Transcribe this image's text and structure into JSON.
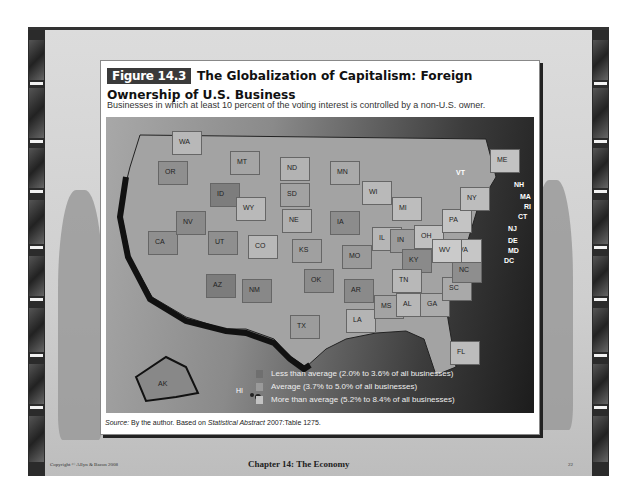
{
  "figure": {
    "badge": "Figure 14.3",
    "title": "The Globalization of Capitalism: Foreign Ownership of U.S. Business",
    "subtitle": "Businesses in which at least 10 percent of the voting interest is controlled by a non-U.S. owner."
  },
  "map": {
    "states": [
      {
        "code": "WA",
        "x": 42,
        "y": 12,
        "shade": "#b8b8b8"
      },
      {
        "code": "OR",
        "x": 28,
        "y": 42,
        "shade": "#8f8f8f"
      },
      {
        "code": "CA",
        "x": 18,
        "y": 112,
        "shade": "#8f8f8f"
      },
      {
        "code": "ID",
        "x": 80,
        "y": 64,
        "shade": "#7d7d7d"
      },
      {
        "code": "NV",
        "x": 46,
        "y": 92,
        "shade": "#8a8a8a"
      },
      {
        "code": "MT",
        "x": 100,
        "y": 32,
        "shade": "#a5a5a5"
      },
      {
        "code": "WY",
        "x": 106,
        "y": 78,
        "shade": "#b9b9b9"
      },
      {
        "code": "UT",
        "x": 78,
        "y": 112,
        "shade": "#8f8f8f"
      },
      {
        "code": "CO",
        "x": 118,
        "y": 116,
        "shade": "#b8b8b8"
      },
      {
        "code": "AZ",
        "x": 76,
        "y": 155,
        "shade": "#7c7c7c"
      },
      {
        "code": "NM",
        "x": 112,
        "y": 160,
        "shade": "#888888"
      },
      {
        "code": "ND",
        "x": 150,
        "y": 38,
        "shade": "#b3b3b3"
      },
      {
        "code": "SD",
        "x": 150,
        "y": 64,
        "shade": "#a2a2a2"
      },
      {
        "code": "NE",
        "x": 152,
        "y": 90,
        "shade": "#b0b0b0"
      },
      {
        "code": "KS",
        "x": 162,
        "y": 120,
        "shade": "#a0a0a0"
      },
      {
        "code": "OK",
        "x": 174,
        "y": 150,
        "shade": "#8c8c8c"
      },
      {
        "code": "TX",
        "x": 160,
        "y": 196,
        "shade": "#9c9c9c"
      },
      {
        "code": "MN",
        "x": 200,
        "y": 42,
        "shade": "#a9a9a9"
      },
      {
        "code": "IA",
        "x": 200,
        "y": 92,
        "shade": "#8c8c8c"
      },
      {
        "code": "MO",
        "x": 212,
        "y": 126,
        "shade": "#9a9a9a"
      },
      {
        "code": "AR",
        "x": 214,
        "y": 160,
        "shade": "#8a8a8a"
      },
      {
        "code": "LA",
        "x": 216,
        "y": 190,
        "shade": "#b4b4b4"
      },
      {
        "code": "WI",
        "x": 232,
        "y": 62,
        "shade": "#b9b9b9"
      },
      {
        "code": "IL",
        "x": 242,
        "y": 108,
        "shade": "#b6b6b6"
      },
      {
        "code": "MI",
        "x": 262,
        "y": 78,
        "shade": "#bdbdbd"
      },
      {
        "code": "IN",
        "x": 260,
        "y": 110,
        "shade": "#9b9b9b"
      },
      {
        "code": "OH",
        "x": 284,
        "y": 106,
        "shade": "#c0c0c0"
      },
      {
        "code": "KY",
        "x": 272,
        "y": 130,
        "shade": "#8a8a8a"
      },
      {
        "code": "TN",
        "x": 262,
        "y": 150,
        "shade": "#b8b8b8"
      },
      {
        "code": "MS",
        "x": 244,
        "y": 176,
        "shade": "#a3a3a3"
      },
      {
        "code": "AL",
        "x": 266,
        "y": 174,
        "shade": "#b7b7b7"
      },
      {
        "code": "GA",
        "x": 290,
        "y": 174,
        "shade": "#ababab"
      },
      {
        "code": "FL",
        "x": 320,
        "y": 222,
        "shade": "#bcbcbc"
      },
      {
        "code": "SC",
        "x": 312,
        "y": 158,
        "shade": "#a9a9a9"
      },
      {
        "code": "NC",
        "x": 322,
        "y": 140,
        "shade": "#8e8e8e"
      },
      {
        "code": "VA",
        "x": 322,
        "y": 120,
        "shade": "#c6c6c6"
      },
      {
        "code": "WV",
        "x": 302,
        "y": 120,
        "shade": "#cacaca"
      },
      {
        "code": "PA",
        "x": 312,
        "y": 90,
        "shade": "#c4c4c4"
      },
      {
        "code": "NY",
        "x": 330,
        "y": 68,
        "shade": "#bdbdbd"
      },
      {
        "code": "ME",
        "x": 360,
        "y": 30,
        "shade": "#c2c2c2"
      }
    ],
    "callouts": [
      "VT",
      "NH",
      "MA",
      "RI",
      "CT",
      "NJ",
      "DE",
      "MD",
      "DC"
    ],
    "outlying": [
      "AK",
      "HI"
    ]
  },
  "legend": {
    "items": [
      {
        "label": "Less than average (2.0% to 3.6% of all businesses)",
        "color": "#6f6f6f"
      },
      {
        "label": "Average (3.7% to 5.0% of all businesses)",
        "color": "#9a9a9a"
      },
      {
        "label": "More than average (5.2% to 8.4% of all businesses)",
        "color": "#c2c2c2"
      }
    ]
  },
  "source": {
    "prefix": "Source:",
    "text": " By the author. Based on ",
    "italic": "Statistical Abstract",
    "suffix": " 2007:Table 1275."
  },
  "footer": {
    "copyright": "Copyright © Allyn & Bacon 2008",
    "chapter": "Chapter 14: The Economy",
    "page": "22"
  }
}
